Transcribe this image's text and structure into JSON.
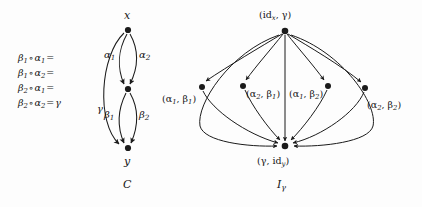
{
  "figure": {
    "background_color": "#fdfdfd",
    "ink_color": "#1b1b1b"
  },
  "left_diagram": {
    "caption": "C",
    "nodes": [
      {
        "id": "x",
        "label": "x",
        "x": 128,
        "y": 30
      },
      {
        "id": "mid",
        "label": "",
        "x": 128,
        "y": 89
      },
      {
        "id": "y",
        "label": "y",
        "x": 128,
        "y": 148
      }
    ],
    "node_label_x": "x",
    "node_label_y": "y",
    "edge_labels": {
      "alpha1": "α",
      "alpha1_sub": "1",
      "alpha2": "α",
      "alpha2_sub": "2",
      "beta1": "β",
      "beta1_sub": "1",
      "beta2": "β",
      "beta2_sub": "2",
      "gamma": "γ"
    },
    "equations": [
      {
        "lhs_b": "β",
        "lhs_b_sub": "1",
        "op": "∘",
        "lhs_a": "α",
        "lhs_a_sub": "1",
        "eq": "=",
        "rhs": ""
      },
      {
        "lhs_b": "β",
        "lhs_b_sub": "1",
        "op": "∘",
        "lhs_a": "α",
        "lhs_a_sub": "2",
        "eq": "=",
        "rhs": ""
      },
      {
        "lhs_b": "β",
        "lhs_b_sub": "2",
        "op": "∘",
        "lhs_a": "α",
        "lhs_a_sub": "1",
        "eq": "=",
        "rhs": ""
      },
      {
        "lhs_b": "β",
        "lhs_b_sub": "2",
        "op": "∘",
        "lhs_a": "α",
        "lhs_a_sub": "2",
        "eq": "=",
        "rhs": "γ"
      }
    ]
  },
  "right_diagram": {
    "caption": "I",
    "caption_sub": "γ",
    "top_node": {
      "label_open": "(id",
      "label_sub": "x",
      "label_rest": ", γ)",
      "x": 285,
      "y": 31
    },
    "bottom_node": {
      "label_open": "(γ, id",
      "label_sub": "y",
      "label_rest": ")",
      "x": 285,
      "y": 146
    },
    "middle_nodes": [
      {
        "label_open": "(α",
        "sub1": "1",
        "mid": ", β",
        "sub2": "1",
        "close": ")",
        "x": 202,
        "y": 87
      },
      {
        "label_open": "(α",
        "sub1": "2",
        "mid": ", β",
        "sub2": "1",
        "close": ")",
        "x": 243,
        "y": 86
      },
      {
        "label_open": "(α",
        "sub1": "1",
        "mid": ", β",
        "sub2": "2",
        "close": ")",
        "x": 328,
        "y": 86
      },
      {
        "label_open": "(α",
        "sub1": "2",
        "mid": ", β",
        "sub2": "2",
        "close": ")",
        "x": 365,
        "y": 88
      }
    ]
  }
}
